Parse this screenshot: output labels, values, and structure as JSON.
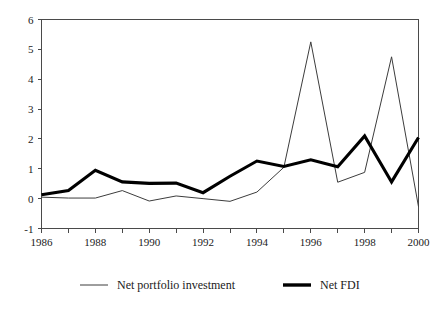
{
  "chart_data": {
    "type": "line",
    "title": "",
    "subtitle": "",
    "xlabel": "",
    "ylabel": "",
    "x": [
      1986,
      1987,
      1988,
      1989,
      1990,
      1991,
      1992,
      1993,
      1994,
      1995,
      1996,
      1997,
      1998,
      1999,
      2000
    ],
    "xlim": [
      1986,
      2000
    ],
    "ylim": [
      -1,
      6
    ],
    "grid": false,
    "legend_position": "bottom",
    "x_tick_labels": [
      "1986",
      "1988",
      "1990",
      "1992",
      "1994",
      "1996",
      "1998",
      "2000"
    ],
    "x_tick_values": [
      1986,
      1988,
      1990,
      1992,
      1994,
      1996,
      1998,
      2000
    ],
    "x_minor_tick_values": [
      1987,
      1989,
      1991,
      1993,
      1995,
      1997,
      1999
    ],
    "y_tick_labels": [
      "6",
      "5",
      "4",
      "3",
      "2",
      "1",
      "0",
      "-1"
    ],
    "y_tick_values": [
      6,
      5,
      4,
      3,
      2,
      1,
      0,
      -1
    ],
    "series": [
      {
        "name": "Net portfolio investment",
        "style": "thin",
        "color": "#3c3c3c",
        "values": [
          0.05,
          0.02,
          0.02,
          0.27,
          -0.08,
          0.09,
          0.0,
          -0.09,
          0.22,
          1.05,
          5.25,
          0.55,
          0.88,
          4.75,
          -0.27
        ]
      },
      {
        "name": "Net FDI",
        "style": "thick",
        "color": "#000000",
        "values": [
          0.13,
          0.27,
          0.95,
          0.56,
          0.51,
          0.52,
          0.2,
          0.75,
          1.26,
          1.08,
          1.3,
          1.07,
          2.1,
          0.56,
          2.05
        ]
      }
    ]
  },
  "legend": {
    "items": [
      {
        "label": "Net portfolio investment",
        "style": "thin"
      },
      {
        "label": "Net FDI",
        "style": "thick"
      }
    ]
  }
}
